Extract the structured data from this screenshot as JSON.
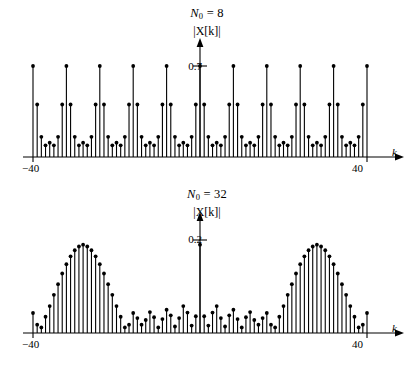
{
  "figure": {
    "caption_present": false,
    "panels": [
      {
        "id": "top",
        "title_prefix": "N",
        "title_sub": "0",
        "title_eq": " = 8",
        "ylabel": "|X[k]|",
        "ytick_label": "0.7",
        "xlabel": "k",
        "xtick_left": "−40",
        "xtick_right": "40"
      },
      {
        "id": "bottom",
        "title_prefix": "N",
        "title_sub": "0",
        "title_eq": " = 32",
        "ylabel": "|X[k]|",
        "ytick_label": "0.2",
        "xlabel": "k",
        "xtick_left": "−40",
        "xtick_right": "40"
      }
    ]
  },
  "colors": {
    "ink": "#000000",
    "background": "#ffffff"
  },
  "chart_data": [
    {
      "type": "line",
      "plot_style": "stem",
      "id": "dft-N0-8",
      "title": "N0 = 8",
      "xlabel": "k",
      "ylabel": "|X[k]|",
      "xlim": [
        -40,
        40
      ],
      "ylim": [
        0,
        0.78
      ],
      "yticks": [
        0.7
      ],
      "ytick_labels": [
        "0.7"
      ],
      "xticks": [
        -40,
        40
      ],
      "xtick_labels": [
        "-40",
        "40"
      ],
      "grid": false,
      "legend": false,
      "period": 8,
      "x": [
        -40,
        -39,
        -38,
        -37,
        -36,
        -35,
        -34,
        -33,
        -32,
        -31,
        -30,
        -29,
        -28,
        -27,
        -26,
        -25,
        -24,
        -23,
        -22,
        -21,
        -20,
        -19,
        -18,
        -17,
        -16,
        -15,
        -14,
        -13,
        -12,
        -11,
        -10,
        -9,
        -8,
        -7,
        -6,
        -5,
        -4,
        -3,
        -2,
        -1,
        0,
        1,
        2,
        3,
        4,
        5,
        6,
        7,
        8,
        9,
        10,
        11,
        12,
        13,
        14,
        15,
        16,
        17,
        18,
        19,
        20,
        21,
        22,
        23,
        24,
        25,
        26,
        27,
        28,
        29,
        30,
        31,
        32,
        33,
        34,
        35,
        36,
        37,
        38,
        39,
        40
      ],
      "values": [
        0.7,
        0.404,
        0.155,
        0.09,
        0.11,
        0.09,
        0.155,
        0.404,
        0.7,
        0.404,
        0.155,
        0.09,
        0.11,
        0.09,
        0.155,
        0.404,
        0.7,
        0.404,
        0.155,
        0.09,
        0.11,
        0.09,
        0.155,
        0.404,
        0.7,
        0.404,
        0.155,
        0.09,
        0.11,
        0.09,
        0.155,
        0.404,
        0.7,
        0.404,
        0.155,
        0.09,
        0.11,
        0.09,
        0.155,
        0.404,
        0.7,
        0.404,
        0.155,
        0.09,
        0.11,
        0.09,
        0.155,
        0.404,
        0.7,
        0.404,
        0.155,
        0.09,
        0.11,
        0.09,
        0.155,
        0.404,
        0.7,
        0.404,
        0.155,
        0.09,
        0.11,
        0.09,
        0.155,
        0.404,
        0.7,
        0.404,
        0.155,
        0.09,
        0.11,
        0.09,
        0.155,
        0.404,
        0.7,
        0.404,
        0.155,
        0.09,
        0.11,
        0.09,
        0.155,
        0.404,
        0.7
      ]
    },
    {
      "type": "line",
      "plot_style": "stem",
      "id": "dft-N0-32",
      "title": "N0 = 32",
      "xlabel": "k",
      "ylabel": "|X[k]|",
      "xlim": [
        -40,
        40
      ],
      "ylim": [
        0,
        0.235
      ],
      "yticks": [
        0.2
      ],
      "ytick_labels": [
        "0.2"
      ],
      "xticks": [
        -40,
        40
      ],
      "xtick_labels": [
        "-40",
        "40"
      ],
      "grid": false,
      "legend": false,
      "period": 32,
      "x": [
        -40,
        -39,
        -38,
        -37,
        -36,
        -35,
        -34,
        -33,
        -32,
        -31,
        -30,
        -29,
        -28,
        -27,
        -26,
        -25,
        -24,
        -23,
        -22,
        -21,
        -20,
        -19,
        -18,
        -17,
        -16,
        -15,
        -14,
        -13,
        -12,
        -11,
        -10,
        -9,
        -8,
        -7,
        -6,
        -5,
        -4,
        -3,
        -2,
        -1,
        0,
        1,
        2,
        3,
        4,
        5,
        6,
        7,
        8,
        9,
        10,
        11,
        12,
        13,
        14,
        15,
        16,
        17,
        18,
        19,
        20,
        21,
        22,
        23,
        24,
        25,
        26,
        27,
        28,
        29,
        30,
        31,
        32,
        33,
        34,
        35,
        36,
        37,
        38,
        39,
        40
      ],
      "values": [
        0.043,
        0.018,
        0.012,
        0.035,
        0.058,
        0.082,
        0.105,
        0.128,
        0.148,
        0.165,
        0.178,
        0.186,
        0.19,
        0.186,
        0.178,
        0.165,
        0.148,
        0.128,
        0.105,
        0.082,
        0.058,
        0.035,
        0.012,
        0.018,
        0.043,
        0.032,
        0.018,
        0.028,
        0.045,
        0.034,
        0.012,
        0.03,
        0.05,
        0.038,
        0.014,
        0.032,
        0.058,
        0.044,
        0.016,
        0.036,
        0.19,
        0.036,
        0.016,
        0.044,
        0.058,
        0.032,
        0.014,
        0.038,
        0.05,
        0.03,
        0.012,
        0.034,
        0.045,
        0.028,
        0.018,
        0.032,
        0.043,
        0.018,
        0.012,
        0.035,
        0.058,
        0.082,
        0.105,
        0.128,
        0.148,
        0.165,
        0.178,
        0.186,
        0.19,
        0.186,
        0.178,
        0.165,
        0.148,
        0.128,
        0.105,
        0.082,
        0.058,
        0.035,
        0.012,
        0.018,
        0.043
      ]
    }
  ]
}
